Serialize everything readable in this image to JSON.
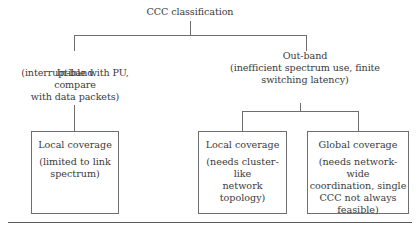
{
  "diagram": {
    "root": {
      "label": "CCC classification"
    },
    "branches": [
      {
        "title": "In-band",
        "desc": "(interruptible with PU, compare\nwith data packets)",
        "children": [
          {
            "title": "Local coverage",
            "desc": "(limited to link\nspectrum)"
          }
        ]
      },
      {
        "title": "Out-band",
        "desc": "(inefficient spectrum use, finite\nswitching latency)",
        "children": [
          {
            "title": "Local coverage",
            "desc": "(needs cluster-like\nnetwork topology)"
          },
          {
            "title": "Global coverage",
            "desc": "(needs network-wide\ncoordination, single\nCCC not always\nfeasible)"
          }
        ]
      }
    ],
    "colors": {
      "line": "#6e6e6e",
      "text": "#3a3a3a",
      "background": "#ffffff"
    }
  }
}
